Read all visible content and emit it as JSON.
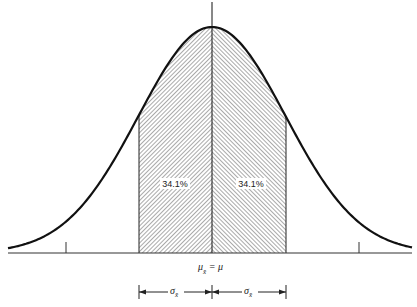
{
  "diagram": {
    "type": "normal-distribution-curve",
    "regions": [
      {
        "label": "34.1%",
        "side": "left",
        "hatch": "backslash"
      },
      {
        "label": "34.1%",
        "side": "right",
        "hatch": "slash"
      }
    ],
    "center_label": {
      "main": "μ",
      "sub": "x̄",
      "rest": " = μ"
    },
    "interval_labels": [
      {
        "main": "σ",
        "sub": "x̄"
      },
      {
        "main": "σ",
        "sub": "x̄"
      }
    ],
    "colors": {
      "line": "#111111",
      "hatch": "#555555",
      "background": "#ffffff"
    }
  }
}
